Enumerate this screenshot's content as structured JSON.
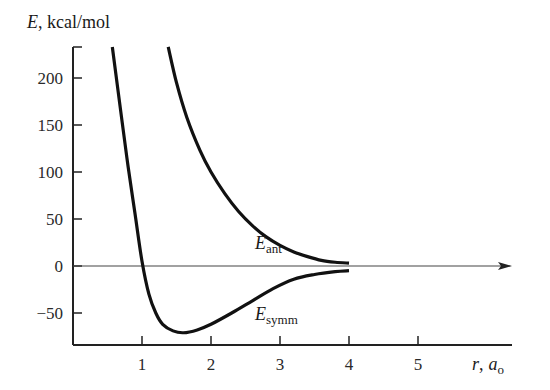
{
  "chart_data": {
    "type": "line",
    "title": "",
    "ylabel": "E, kcal/mol",
    "ylabel_var": "E",
    "ylabel_unit": "kcal/mol",
    "xlabel": "r, a0",
    "xlabel_var": "r",
    "xlabel_unit_main": "a",
    "xlabel_unit_sub": "o",
    "xlim": [
      0,
      5.6
    ],
    "ylim": [
      -84,
      233
    ],
    "grid": false,
    "legend": "inline labels",
    "x_ticks": [
      1,
      2,
      3,
      4,
      5
    ],
    "y_ticks": [
      200,
      150,
      100,
      50,
      0,
      -50
    ],
    "y_tick_labels": [
      "200",
      "150",
      "100",
      "50",
      "0",
      "−50"
    ],
    "zero_line": {
      "y": 0,
      "arrow": true
    },
    "series": [
      {
        "name": "E_symm",
        "label_main": "E",
        "label_sub": "symm",
        "x": [
          0.57,
          0.7,
          0.8,
          0.9,
          1.0,
          1.1,
          1.2,
          1.3,
          1.45,
          1.6,
          1.8,
          2.0,
          2.3,
          2.6,
          2.9,
          3.2,
          3.5,
          3.8,
          4.0
        ],
        "y": [
          233,
          160,
          105,
          55,
          5,
          -30,
          -50,
          -62,
          -69,
          -71,
          -68,
          -62,
          -50,
          -37,
          -24,
          -14,
          -9,
          -6,
          -5
        ]
      },
      {
        "name": "E_ant",
        "label_main": "E",
        "label_sub": "ant",
        "x": [
          1.38,
          1.5,
          1.65,
          1.84,
          2.0,
          2.2,
          2.4,
          2.6,
          2.8,
          3.0,
          3.2,
          3.4,
          3.6,
          3.8,
          4.0
        ],
        "y": [
          233,
          195,
          158,
          123,
          100,
          77,
          58,
          43,
          31,
          22,
          15,
          10,
          6,
          4,
          3
        ]
      }
    ]
  },
  "labels": {
    "ylabel_var": "E",
    "ylabel_rest": ", kcal/mol",
    "xlabel_var": "r",
    "xlabel_sep": ",",
    "xlabel_unit": "a",
    "xlabel_unit_sub": "o",
    "ant_main": "E",
    "ant_sub": "ant",
    "symm_main": "E",
    "symm_sub": "symm"
  }
}
